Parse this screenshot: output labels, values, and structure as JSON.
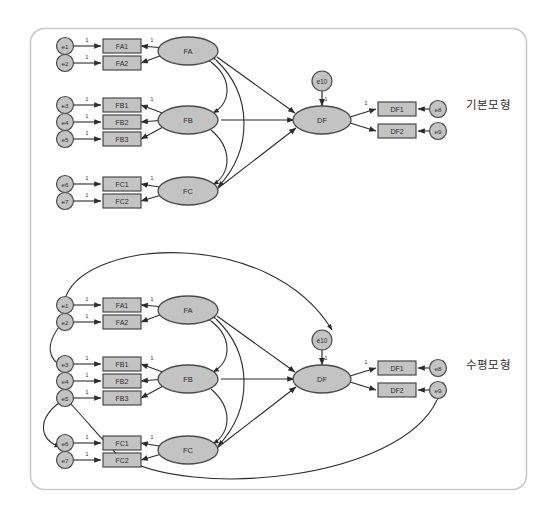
{
  "figure": {
    "type": "sem-path-diagram",
    "frame": {
      "x": 30,
      "y": 28,
      "width": 497,
      "height": 462,
      "radius": 14,
      "border_color": "#c9c9c9",
      "background": "#ffffff"
    }
  },
  "style": {
    "node_fill": "#c3c3c3",
    "node_stroke": "#4a4a4a",
    "box_fill": "#c3c3c3",
    "path_color": "#2b2b2b",
    "label_color": "#2b2b2b",
    "weight_label": "1"
  },
  "models": [
    {
      "id": "basic",
      "label": "기본모형",
      "label_position": {
        "x": 466,
        "y": 96
      },
      "errors_exogenous": [
        "e1",
        "e2",
        "e3",
        "e4",
        "e5",
        "e6",
        "e7"
      ],
      "indicators_exogenous": [
        "FA1",
        "FA2",
        "FB1",
        "FB2",
        "FB3",
        "FC1",
        "FC2"
      ],
      "latent_exogenous": [
        "FA",
        "FB",
        "FC"
      ],
      "latent_endogenous": "DF",
      "disturbance": "e10",
      "indicators_endogenous": [
        "DF1",
        "DF2"
      ],
      "errors_endogenous": [
        "e8",
        "e9"
      ],
      "covariances": [
        "FA<->FB",
        "FA<->FC",
        "FB<->FC"
      ],
      "structural_paths": [
        "FA->DF",
        "FB->DF",
        "FC->DF"
      ],
      "correlated_errors": []
    },
    {
      "id": "horizontal",
      "label": "수평모형",
      "label_position": {
        "x": 466,
        "y": 356
      },
      "errors_exogenous": [
        "e1",
        "e2",
        "e3",
        "e4",
        "e5",
        "e6",
        "e7"
      ],
      "indicators_exogenous": [
        "FA1",
        "FA2",
        "FB1",
        "FB2",
        "FB3",
        "FC1",
        "FC2"
      ],
      "latent_exogenous": [
        "FA",
        "FB",
        "FC"
      ],
      "latent_endogenous": "DF",
      "disturbance": "e10",
      "indicators_endogenous": [
        "DF1",
        "DF2"
      ],
      "errors_endogenous": [
        "e8",
        "e9"
      ],
      "covariances": [
        "FA<->FB",
        "FA<->FC",
        "FB<->FC"
      ],
      "structural_paths": [
        "FA->DF",
        "FB->DF",
        "FC->DF"
      ],
      "correlated_errors": [
        "e1<->e10",
        "e2<->e3",
        "e5<->e6",
        "e5<->FC2",
        "e9<->e7"
      ]
    }
  ],
  "measurement_weights": {
    "FA1": "1",
    "FA2": "1",
    "FB1": "1",
    "FB2": "1",
    "FB3": "1",
    "FC1": "1",
    "FC2": "1",
    "DF1": "1",
    "DF2": "1"
  },
  "error_weights": {
    "e1": "1",
    "e2": "1",
    "e3": "1",
    "e4": "1",
    "e5": "1",
    "e6": "1",
    "e7": "1",
    "e8": "1",
    "e9": "1",
    "e10": "1"
  }
}
